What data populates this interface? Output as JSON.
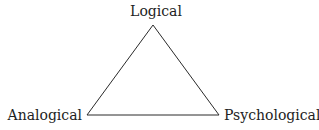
{
  "diagram": {
    "type": "triangle",
    "vertices": [
      {
        "id": "logical",
        "label": "Logical",
        "position": "top"
      },
      {
        "id": "analogical",
        "label": "Analogical",
        "position": "bottom-left"
      },
      {
        "id": "psychological",
        "label": "Psychological",
        "position": "bottom-right"
      }
    ],
    "edges": [
      {
        "from": "logical",
        "to": "analogical"
      },
      {
        "from": "analogical",
        "to": "psychological"
      },
      {
        "from": "psychological",
        "to": "logical"
      }
    ],
    "colors": {
      "line": "#2a2a2a",
      "text": "#222222",
      "background": "#ffffff"
    }
  }
}
